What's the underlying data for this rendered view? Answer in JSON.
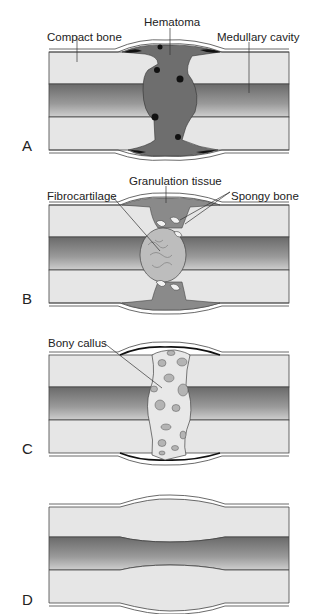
{
  "diagram": {
    "colors": {
      "compact_bone": "#e6e6e6",
      "medullary_dark": "#707070",
      "medullary_light": "#c8c8c8",
      "hematoma": "#6e6e6e",
      "clot_dark": "#111111",
      "granulation": "#8a8a8a",
      "fibrocartilage": "#bdbdbd",
      "callus": "#e8e8e8",
      "callus_spots": "#b4b4b4",
      "outline": "#333333"
    },
    "panels": [
      {
        "letter": "A",
        "labels": [
          {
            "text": "Compact bone"
          },
          {
            "text": "Hematoma"
          },
          {
            "text": "Medullary cavity"
          }
        ]
      },
      {
        "letter": "B",
        "labels": [
          {
            "text": "Fibrocartilage"
          },
          {
            "text": "Granulation tissue"
          },
          {
            "text": "Spongy bone"
          }
        ]
      },
      {
        "letter": "C",
        "labels": [
          {
            "text": "Bony callus"
          }
        ]
      },
      {
        "letter": "D",
        "labels": []
      }
    ]
  }
}
